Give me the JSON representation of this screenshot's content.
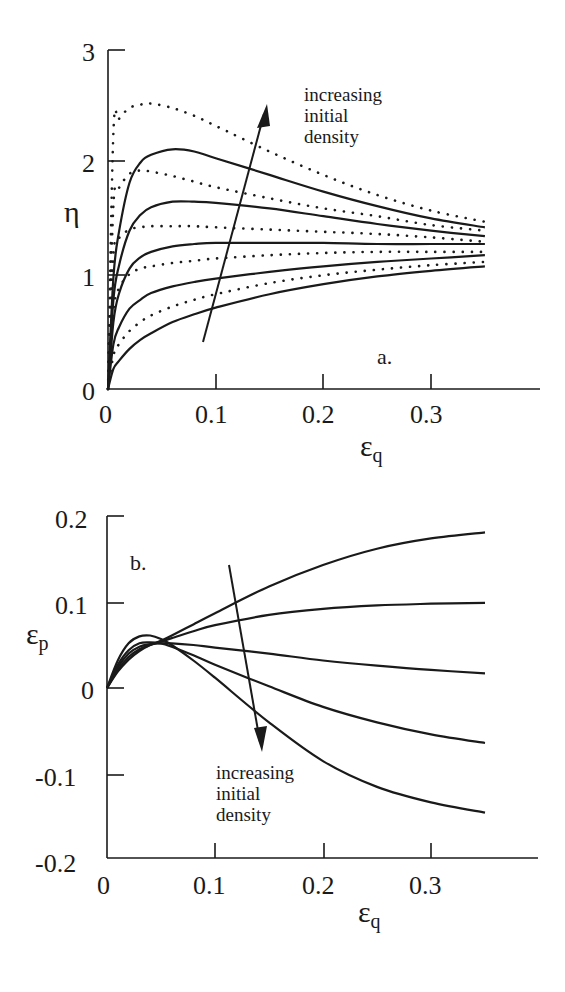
{
  "figure": {
    "panel_a": {
      "label": "a.",
      "ylabel": "η",
      "xlabel_main": "ε",
      "xlabel_sub": "q",
      "yticks": [
        "0",
        "1",
        "2",
        "3"
      ],
      "xticks": [
        "0",
        "0.1",
        "0.2",
        "0.3"
      ],
      "annotation": [
        "increasing",
        "initial",
        "density"
      ]
    },
    "panel_b": {
      "label": "b.",
      "ylabel_main": "ε",
      "ylabel_sub": "p",
      "xlabel_main": "ε",
      "xlabel_sub": "q",
      "yticks": [
        "0.2",
        "0.1",
        "0",
        "-0.1",
        "-0.2"
      ],
      "xticks": [
        "0",
        "0.1",
        "0.2",
        "0.3"
      ],
      "annotation": [
        "increasing",
        "initial",
        "density"
      ]
    }
  },
  "chart_data": [
    {
      "type": "line",
      "title": "",
      "panel": "a.",
      "xlabel": "ε_q",
      "ylabel": "η",
      "xlim": [
        0,
        0.4
      ],
      "ylim": [
        0,
        3
      ],
      "xticks": [
        0,
        0.1,
        0.2,
        0.3
      ],
      "yticks": [
        0,
        1,
        2,
        3
      ],
      "grid": false,
      "legend": null,
      "annotations": [
        {
          "text": "increasing initial density",
          "arrow_from": [
            0.088,
            0.42
          ],
          "arrow_to": [
            0.147,
            2.55
          ]
        },
        {
          "text": "a.",
          "position": [
            0.27,
            0.15
          ]
        }
      ],
      "x": [
        0,
        0.005,
        0.01,
        0.02,
        0.03,
        0.04,
        0.06,
        0.08,
        0.1,
        0.15,
        0.2,
        0.25,
        0.3,
        0.35
      ],
      "series": [
        {
          "name": "solid 1 (lowest density)",
          "style": "solid",
          "values": [
            0,
            0.18,
            0.25,
            0.36,
            0.44,
            0.5,
            0.6,
            0.67,
            0.73,
            0.85,
            0.94,
            1.01,
            1.06,
            1.1
          ]
        },
        {
          "name": "dotted 1",
          "style": "dotted",
          "values": [
            0,
            0.3,
            0.4,
            0.52,
            0.6,
            0.66,
            0.74,
            0.8,
            0.85,
            0.95,
            1.02,
            1.07,
            1.11,
            1.14
          ]
        },
        {
          "name": "solid 2",
          "style": "solid",
          "values": [
            0,
            0.4,
            0.55,
            0.72,
            0.8,
            0.86,
            0.92,
            0.96,
            0.99,
            1.05,
            1.1,
            1.14,
            1.17,
            1.2
          ]
        },
        {
          "name": "dotted 2",
          "style": "dotted",
          "values": [
            0,
            0.7,
            0.9,
            1.03,
            1.08,
            1.1,
            1.13,
            1.15,
            1.17,
            1.2,
            1.22,
            1.23,
            1.23,
            1.23
          ]
        },
        {
          "name": "solid 3",
          "style": "solid",
          "values": [
            0,
            0.6,
            0.85,
            1.08,
            1.18,
            1.23,
            1.28,
            1.3,
            1.31,
            1.31,
            1.31,
            1.3,
            1.3,
            1.3
          ]
        },
        {
          "name": "dotted 3",
          "style": "dotted",
          "values": [
            0,
            1.2,
            1.35,
            1.43,
            1.45,
            1.46,
            1.46,
            1.46,
            1.45,
            1.43,
            1.41,
            1.39,
            1.36,
            1.32
          ]
        },
        {
          "name": "solid 4",
          "style": "solid",
          "values": [
            0,
            0.8,
            1.1,
            1.42,
            1.56,
            1.63,
            1.68,
            1.68,
            1.67,
            1.62,
            1.55,
            1.48,
            1.42,
            1.37
          ]
        },
        {
          "name": "dotted 4",
          "style": "dotted",
          "values": [
            0,
            1.65,
            1.8,
            1.93,
            1.96,
            1.95,
            1.91,
            1.86,
            1.81,
            1.71,
            1.62,
            1.55,
            1.47,
            1.42
          ]
        },
        {
          "name": "solid 5",
          "style": "solid",
          "values": [
            0,
            1.0,
            1.4,
            1.85,
            2.03,
            2.1,
            2.15,
            2.13,
            2.07,
            1.92,
            1.77,
            1.64,
            1.53,
            1.45
          ]
        },
        {
          "name": "dotted 5 (highest density)",
          "style": "dotted",
          "values": [
            0,
            2.3,
            2.42,
            2.52,
            2.55,
            2.56,
            2.52,
            2.45,
            2.36,
            2.13,
            1.92,
            1.74,
            1.6,
            1.5
          ]
        }
      ]
    },
    {
      "type": "line",
      "title": "",
      "panel": "b.",
      "xlabel": "ε_q",
      "ylabel": "ε_p",
      "xlim": [
        0,
        0.4
      ],
      "ylim": [
        -0.2,
        0.2
      ],
      "xticks": [
        0,
        0.1,
        0.2,
        0.3
      ],
      "yticks": [
        -0.2,
        -0.1,
        0,
        0.1,
        0.2
      ],
      "grid": false,
      "legend": null,
      "annotations": [
        {
          "text": "increasing initial density",
          "arrow_from": [
            0.113,
            0.142
          ],
          "arrow_to": [
            0.143,
            -0.075
          ]
        },
        {
          "text": "b.",
          "position": [
            0.02,
            0.155
          ]
        }
      ],
      "x": [
        0,
        0.01,
        0.02,
        0.03,
        0.04,
        0.05,
        0.06,
        0.08,
        0.1,
        0.15,
        0.2,
        0.25,
        0.3,
        0.35
      ],
      "series": [
        {
          "name": "curve 1 (lowest density)",
          "style": "solid",
          "values": [
            0,
            0.019,
            0.033,
            0.043,
            0.05,
            0.055,
            0.061,
            0.074,
            0.087,
            0.118,
            0.143,
            0.162,
            0.174,
            0.181
          ]
        },
        {
          "name": "curve 2",
          "style": "solid",
          "values": [
            0,
            0.021,
            0.036,
            0.045,
            0.05,
            0.054,
            0.058,
            0.066,
            0.073,
            0.085,
            0.092,
            0.096,
            0.098,
            0.099
          ]
        },
        {
          "name": "curve 3",
          "style": "solid",
          "values": [
            0,
            0.024,
            0.04,
            0.048,
            0.051,
            0.052,
            0.052,
            0.05,
            0.047,
            0.04,
            0.032,
            0.026,
            0.021,
            0.017
          ]
        },
        {
          "name": "curve 4",
          "style": "solid",
          "values": [
            0,
            0.027,
            0.044,
            0.052,
            0.053,
            0.052,
            0.048,
            0.038,
            0.027,
            0.002,
            -0.022,
            -0.04,
            -0.054,
            -0.064
          ]
        },
        {
          "name": "curve 5 (highest density)",
          "style": "solid",
          "values": [
            0,
            0.032,
            0.052,
            0.06,
            0.061,
            0.057,
            0.05,
            0.032,
            0.012,
            -0.04,
            -0.085,
            -0.115,
            -0.133,
            -0.145
          ]
        }
      ]
    }
  ]
}
